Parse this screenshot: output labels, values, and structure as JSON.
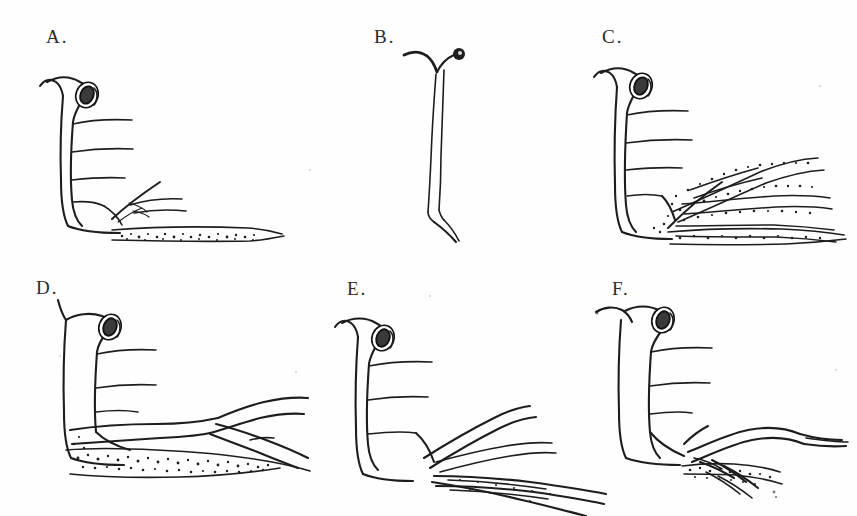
{
  "figure": {
    "kind": "scientific-line-drawing-plate",
    "medium": "ink drawing, scanned",
    "background_color": "#fefefe",
    "ink_color": "#1d1d1d",
    "panel_count": 6,
    "layout": {
      "rows": 2,
      "cols": 3
    },
    "caption": ""
  },
  "panels": [
    {
      "id": "A",
      "label": "A.",
      "label_x": 46,
      "label_y": 26,
      "description": "Organism with oval ring-shaped head opening at upper right of a hooked neck, vertical body trunk on the left with four horizontal lateral branches, a short spray of fine branches at lower right, and a stippled horizontal basal band along the bottom.",
      "features": [
        "ring-head",
        "trunk",
        "lateral-branches",
        "fine-branch-spray",
        "stippled-basal-band"
      ],
      "lateral_branch_count": 4,
      "stippling": "light"
    },
    {
      "id": "B",
      "label": "B.",
      "label_x": 374,
      "label_y": 26,
      "description": "Isolated slender Y-shaped stalk, forked at the top with a small solid dark knob on the right fork tip, tapering downward into a long thin tail.",
      "features": [
        "forked-top",
        "dark-knob",
        "slender-stalk",
        "tapering-tail"
      ],
      "lateral_branch_count": 0,
      "stippling": "none"
    },
    {
      "id": "C",
      "label": "C.",
      "label_x": 602,
      "label_y": 26,
      "description": "Same body plan as A but with an extensive fan of five heavily stippled branching tubes radiating to the right, plus a stippled basal band along the bottom.",
      "features": [
        "ring-head",
        "trunk",
        "lateral-branches",
        "stippled-branch-fan",
        "stippled-basal-band"
      ],
      "lateral_branch_count": 4,
      "branch_fan_count": 5,
      "stippling": "heavy"
    },
    {
      "id": "D",
      "label": "D.",
      "label_x": 36,
      "label_y": 277,
      "description": "Body with ring head, three lateral branches, a long forked tube extending far to the right, and a broad densely stippled band running along the base.",
      "features": [
        "ring-head",
        "trunk",
        "lateral-branches",
        "long-forked-tube",
        "dense-stippled-band"
      ],
      "lateral_branch_count": 3,
      "stippling": "dense"
    },
    {
      "id": "E",
      "label": "E.",
      "label_x": 347,
      "label_y": 278,
      "description": "Body with ring head and three lateral branches; lower right shows several long slender tapering tubes sweeping to the right and downward, lightly stippled.",
      "features": [
        "ring-head",
        "trunk",
        "lateral-branches",
        "long-tapering-tubes"
      ],
      "lateral_branch_count": 3,
      "stippling": "light"
    },
    {
      "id": "F",
      "label": "F.",
      "label_x": 612,
      "label_y": 278,
      "description": "Body with ring head and three lateral branches; a broad wavy tube sweeps right while a cluster of short stippled claw-like spines points right-downward at the base.",
      "features": [
        "ring-head",
        "trunk",
        "lateral-branches",
        "wavy-tube",
        "stippled-claw-cluster"
      ],
      "lateral_branch_count": 3,
      "stippling": "moderate"
    }
  ]
}
